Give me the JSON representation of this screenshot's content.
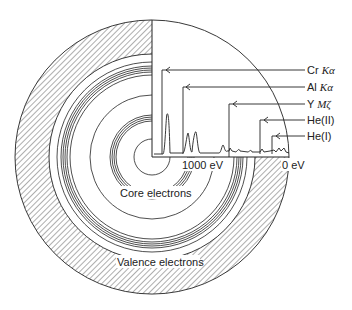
{
  "diagram": {
    "regions": {
      "core": "Core electrons",
      "valence": "Valence electrons"
    },
    "axis": {
      "left_tick": "1000 eV",
      "right_tick": "0 eV"
    },
    "sources": [
      {
        "element": "Cr",
        "line": "Kα"
      },
      {
        "element": "Al",
        "line": "Kα"
      },
      {
        "element": "Y",
        "line": "Mζ"
      },
      {
        "element": "He(II)",
        "line": ""
      },
      {
        "element": "He(I)",
        "line": ""
      }
    ],
    "colors": {
      "ink": "#222222",
      "background": "#ffffff"
    }
  }
}
